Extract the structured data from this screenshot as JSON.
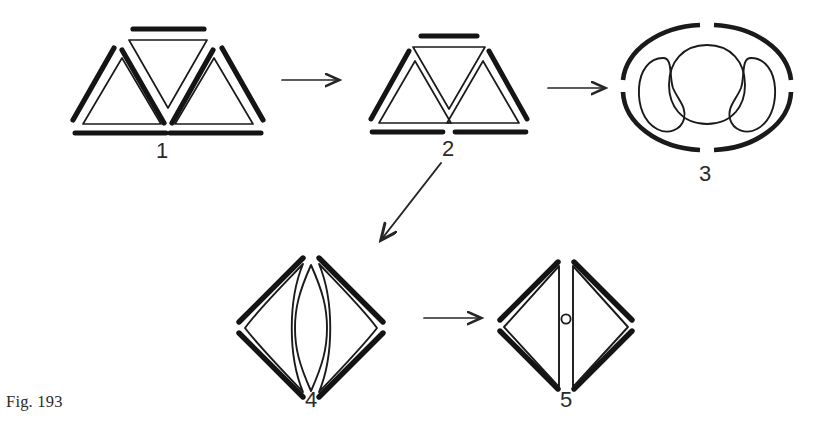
{
  "figure": {
    "caption": "Fig. 193",
    "kind": "morphological-transformation-series",
    "background_color": "#ffffff",
    "ink_color": "#1a1a1a",
    "stages": [
      {
        "id": "1",
        "label": "1",
        "description": "Three thin triangles (up, down, up) each shadowed by a heavy offset stroke; widely spaced",
        "label_x": 162,
        "label_y": 138
      },
      {
        "id": "2",
        "label": "2",
        "description": "Same three triangles drawn closer together so their edges touch; heavy strokes reduced",
        "label_x": 448,
        "label_y": 136
      },
      {
        "id": "3",
        "label": "3",
        "description": "Ellipse of four heavy dashed arcs enclosing three rounded lobes",
        "label_x": 705,
        "label_y": 161
      },
      {
        "id": "4",
        "label": "4",
        "description": "Diamond of four heavy strokes enclosing a central lens flanked by two curved panels",
        "label_x": 311,
        "label_y": 387
      },
      {
        "id": "5",
        "label": "5",
        "description": "Diamond of four heavy strokes enclosing two inward-pointing triangles with a small circle between them",
        "label_x": 566,
        "label_y": 387
      }
    ],
    "arrows": [
      {
        "name": "arrow-1-to-2",
        "from": "1",
        "to": "2",
        "direction": "right"
      },
      {
        "name": "arrow-2-to-3",
        "from": "2",
        "to": "3",
        "direction": "right"
      },
      {
        "name": "arrow-2-to-4",
        "from": "2",
        "to": "4",
        "direction": "down-left"
      },
      {
        "name": "arrow-4-to-5",
        "from": "4",
        "to": "5",
        "direction": "right"
      }
    ]
  }
}
